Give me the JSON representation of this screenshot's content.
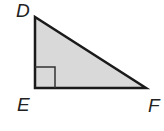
{
  "diagram": {
    "type": "right-triangle",
    "fill_color": "#d9d9d9",
    "stroke_color": "#1a1a1a",
    "vertices": {
      "D": {
        "label": "D",
        "x": 35,
        "y": 17
      },
      "E": {
        "label": "E",
        "x": 35,
        "y": 88
      },
      "F": {
        "label": "F",
        "x": 146,
        "y": 88
      }
    },
    "right_angle_at": "E",
    "labels": {
      "D": "D",
      "E": "E",
      "F": "F"
    }
  }
}
